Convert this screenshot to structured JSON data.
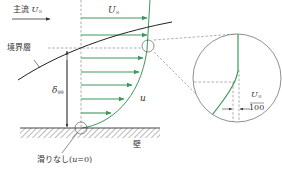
{
  "diagram": {
    "labels": {
      "main_flow_prefix": "主流",
      "main_flow_symbol": "U",
      "main_flow_sub": "∞",
      "free_stream_symbol": "U",
      "free_stream_sub": "∞",
      "boundary_layer": "境界層",
      "delta_symbol": "δ",
      "delta_sub": "99",
      "velocity_u": "u",
      "wall": "壁",
      "no_slip": "滑りなし(",
      "no_slip_var": "u",
      "no_slip_tail": "=0)",
      "inset_numerator_symbol": "U",
      "inset_numerator_sub": "∞",
      "inset_denominator": "100"
    },
    "colors": {
      "profile_green": "#3a9a5c",
      "line_dark": "#333333",
      "dashed_gray": "#777777"
    },
    "arrows_y": [
      18,
      35,
      58,
      72,
      85,
      99,
      113
    ]
  }
}
